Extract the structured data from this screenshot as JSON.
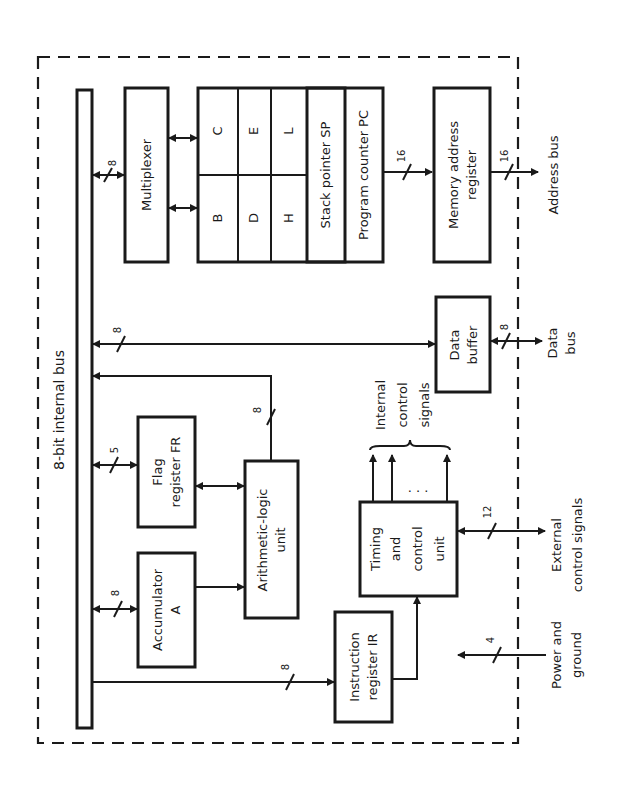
{
  "diagram": {
    "orientation": "rotated 90 degrees counter-clockwise",
    "internal_bus": {
      "label": "8-bit internal bus"
    },
    "blocks": {
      "multiplexer": {
        "label": "Multiplexer"
      },
      "registers": {
        "B": "B",
        "C": "C",
        "D": "D",
        "E": "E",
        "H": "H",
        "L": "L",
        "stack_pointer": "Stack pointer SP",
        "program_counter": "Program counter PC"
      },
      "memory_address_register": {
        "line1": "Memory address",
        "line2": "register"
      },
      "data_buffer": {
        "line1": "Data",
        "line2": "buffer"
      },
      "flag_register": {
        "line1": "Flag",
        "line2": "register FR"
      },
      "alu": {
        "line1": "Arithmetic-logic",
        "line2": "unit"
      },
      "accumulator": {
        "line1": "Accumulator",
        "line2": "A"
      },
      "timing_control": {
        "line1": "Timing",
        "line2": "and",
        "line3": "control",
        "line4": "unit"
      },
      "instruction_register": {
        "line1": "Instruction",
        "line2": "register IR"
      }
    },
    "bus_widths": {
      "bus_to_multiplexer": "8",
      "bus_to_data_buffer": "8",
      "alu_to_bus": "8",
      "bus_to_flag_register": "5",
      "bus_to_accumulator": "8",
      "bus_to_instruction_register": "8",
      "pc_to_mar": "16",
      "address_bus": "16",
      "data_bus": "8",
      "external_control": "12",
      "power_ground": "4"
    },
    "external_labels": {
      "address_bus": "Address bus",
      "data_bus_line1": "Data",
      "data_bus_line2": "bus",
      "external_control_line1": "External",
      "external_control_line2": "control signals",
      "power_line1": "Power and",
      "power_line2": "ground",
      "internal_control_line1": "Internal",
      "internal_control_line2": "control",
      "internal_control_line3": "signals",
      "ellipsis": ". . ."
    },
    "colors": {
      "ink": "#1a1a1a",
      "background": "#ffffff"
    }
  }
}
